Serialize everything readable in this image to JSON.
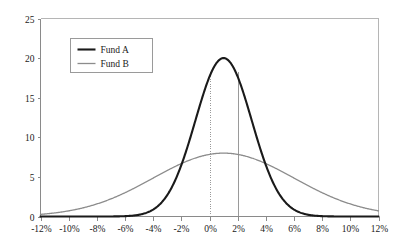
{
  "chart_data": {
    "type": "line",
    "title": "",
    "subtitle": "",
    "xlabel": "",
    "ylabel": "",
    "xlim": [
      -12,
      12
    ],
    "ylim": [
      0,
      25
    ],
    "grid": false,
    "legend_position": "upper-left-inside",
    "x_tick_labels": [
      "-12%",
      "-10%",
      "-8%",
      "-6%",
      "-4%",
      "-2%",
      "0%",
      "2%",
      "4%",
      "6%",
      "8%",
      "10%",
      "12%"
    ],
    "x_tick_values": [
      -12,
      -10,
      -8,
      -6,
      -4,
      -2,
      0,
      2,
      4,
      6,
      8,
      10,
      12
    ],
    "y_tick_labels": [
      "0",
      "5",
      "10",
      "15",
      "20",
      "25"
    ],
    "y_tick_values": [
      0,
      5,
      10,
      15,
      20,
      25
    ],
    "annotations": [
      {
        "name": "reference-line-0pct",
        "x": 0,
        "label": "0%",
        "style": "vertical-line-dotted"
      },
      {
        "name": "reference-line-2pct",
        "x": 2,
        "label": "2%",
        "style": "vertical-line-solid"
      }
    ],
    "series": [
      {
        "name": "Fund A",
        "color": "#1a1a1a",
        "line_width": 2.1,
        "mean": 1.0,
        "sigma": 2.0,
        "peak_value": 20,
        "peak_x": 1,
        "x": [
          -12,
          -11,
          -10,
          -9,
          -8,
          -7,
          -6,
          -5.5,
          -5,
          -4.5,
          -4,
          -3.5,
          -3,
          -2.5,
          -2,
          -1.5,
          -1,
          -0.5,
          0,
          0.5,
          1,
          1.5,
          2,
          2.5,
          3,
          3.5,
          4,
          4.5,
          5,
          5.5,
          6,
          6.5,
          7,
          7.5,
          8,
          9,
          10,
          11,
          12
        ],
        "y": [
          0.0,
          0.0,
          0.01,
          0.03,
          0.09,
          0.22,
          0.53,
          0.8,
          1.2,
          1.75,
          2.5,
          3.45,
          4.6,
          5.95,
          7.45,
          9.05,
          10.7,
          12.3,
          13.8,
          15.1,
          16.2,
          17.0,
          19.0,
          19.6,
          20.0,
          19.6,
          19.0,
          17.0,
          16.2,
          15.1,
          13.8,
          8.0,
          4.6,
          2.5,
          1.2,
          0.22,
          0.03,
          0.0,
          0.0
        ]
      },
      {
        "name": "Fund B",
        "color": "#8c8c8c",
        "line_width": 1.3,
        "mean": 1.0,
        "sigma": 5.0,
        "peak_value": 8,
        "peak_x": 1,
        "x": [
          -12,
          -11,
          -10,
          -9,
          -8,
          -7,
          -6,
          -5,
          -4,
          -3,
          -2,
          -1,
          0,
          1,
          2,
          3,
          4,
          5,
          6,
          7,
          8,
          9,
          10,
          11,
          12
        ],
        "y": [
          0.35,
          0.55,
          0.8,
          1.15,
          1.6,
          2.2,
          2.9,
          3.7,
          4.6,
          5.5,
          6.4,
          7.2,
          7.75,
          8.0,
          7.95,
          7.6,
          7.0,
          6.25,
          5.4,
          4.5,
          3.65,
          2.85,
          2.15,
          1.55,
          1.05
        ]
      }
    ],
    "legend_entries": [
      {
        "label": "Fund A",
        "color": "#1a1a1a",
        "line_width": 2.1
      },
      {
        "label": "Fund B",
        "color": "#8c8c8c",
        "line_width": 1.3
      }
    ]
  },
  "colors": {
    "fund_a": "#1a1a1a",
    "fund_b": "#8c8c8c",
    "axis": "#8a8a8a",
    "frame": "#b5b5b5",
    "reference_line": "#9a9a9a",
    "background": "#ffffff"
  }
}
